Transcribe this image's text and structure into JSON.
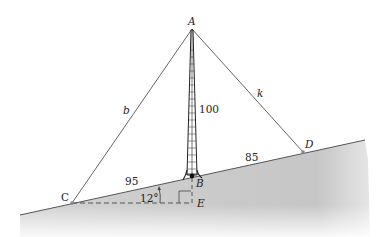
{
  "diagram": {
    "type": "geometry-figure",
    "points": {
      "A": {
        "label": "A",
        "x": 192,
        "y": 29
      },
      "B": {
        "label": "B",
        "x": 192,
        "y": 176
      },
      "C": {
        "label": "C",
        "x": 72,
        "y": 203
      },
      "D": {
        "label": "D",
        "x": 303,
        "y": 152
      },
      "E": {
        "label": "E",
        "x": 192,
        "y": 203
      }
    },
    "segments": {
      "AC": {
        "label": "b"
      },
      "AD": {
        "label": "k"
      },
      "AB": {
        "label": "100"
      },
      "CB": {
        "label": "95"
      },
      "BD": {
        "label": "85"
      }
    },
    "angle": {
      "label": "12°",
      "vertex": "C"
    },
    "colors": {
      "line": "#555555",
      "ground": "#c8c8c8",
      "tower": "#222222",
      "dashed": "#555555"
    }
  }
}
